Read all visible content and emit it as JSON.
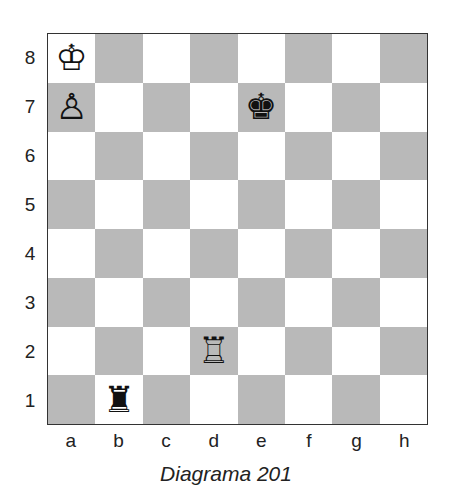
{
  "diagram": {
    "caption": "Diagrama 201",
    "ranks": [
      "8",
      "7",
      "6",
      "5",
      "4",
      "3",
      "2",
      "1"
    ],
    "files": [
      "a",
      "b",
      "c",
      "d",
      "e",
      "f",
      "g",
      "h"
    ],
    "pieces": [
      {
        "square": "a8",
        "piece": "white-king",
        "glyph": "♔"
      },
      {
        "square": "a7",
        "piece": "white-pawn",
        "glyph": "♙"
      },
      {
        "square": "e7",
        "piece": "black-king",
        "glyph": "♚"
      },
      {
        "square": "d2",
        "piece": "white-rook",
        "glyph": "♖"
      },
      {
        "square": "b1",
        "piece": "black-rook",
        "glyph": "♜"
      }
    ],
    "colors": {
      "light_square": "#ffffff",
      "dark_square": "#b9b9b9",
      "border": "#333333"
    }
  }
}
